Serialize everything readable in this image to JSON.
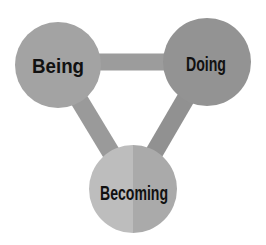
{
  "diagram": {
    "type": "triangle-cycle",
    "nodes": [
      {
        "id": "being",
        "label": "Being",
        "cx": 58,
        "cy": 65,
        "r": 43,
        "color": "#a3a3a3"
      },
      {
        "id": "doing",
        "label": "Doing",
        "cx": 207,
        "cy": 62,
        "r": 44,
        "color": "#939393"
      },
      {
        "id": "becoming",
        "label": "Becoming",
        "cx": 133,
        "cy": 189,
        "r": 44,
        "color_left": "#bdbdbd",
        "color_right": "#aaaaaa"
      }
    ],
    "connectors": [
      {
        "from": "being",
        "to": "doing",
        "color": "#9c9c9c"
      },
      {
        "from": "being",
        "to": "becoming",
        "color": "#9a9a9a"
      },
      {
        "from": "doing",
        "to": "becoming",
        "color": "#919191"
      }
    ],
    "background": "#ffffff"
  }
}
